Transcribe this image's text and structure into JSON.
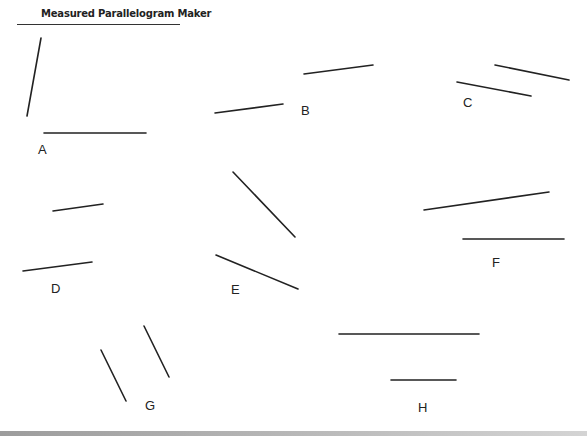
{
  "title": "Measured Parallelogram Maker",
  "line_color": "#222222",
  "figures": [
    {
      "label": "A",
      "label_pos": [
        38,
        143
      ],
      "segments": [
        [
          41,
          38,
          27,
          116
        ],
        [
          44,
          133,
          146,
          133
        ]
      ]
    },
    {
      "label": "B",
      "label_pos": [
        301,
        104
      ],
      "segments": [
        [
          304,
          74,
          373,
          65
        ],
        [
          215,
          113,
          283,
          104
        ]
      ]
    },
    {
      "label": "C",
      "label_pos": [
        463,
        96
      ],
      "segments": [
        [
          495,
          65,
          569,
          80
        ],
        [
          457,
          82,
          531,
          96
        ]
      ]
    },
    {
      "label": "D",
      "label_pos": [
        51,
        282
      ],
      "segments": [
        [
          53,
          211,
          103,
          204
        ],
        [
          23,
          271,
          92,
          262
        ]
      ]
    },
    {
      "label": "E",
      "label_pos": [
        231,
        283
      ],
      "segments": [
        [
          233,
          172,
          295,
          237
        ],
        [
          216,
          255,
          298,
          289
        ]
      ]
    },
    {
      "label": "F",
      "label_pos": [
        492,
        256
      ],
      "segments": [
        [
          424,
          210,
          549,
          192
        ],
        [
          463,
          239,
          564,
          239
        ]
      ]
    },
    {
      "label": "G",
      "label_pos": [
        145,
        399
      ],
      "segments": [
        [
          144,
          326,
          169,
          377
        ],
        [
          101,
          350,
          126,
          401
        ]
      ]
    },
    {
      "label": "H",
      "label_pos": [
        418,
        401
      ],
      "segments": [
        [
          339,
          334,
          479,
          334
        ],
        [
          391,
          380,
          456,
          380
        ]
      ]
    }
  ]
}
